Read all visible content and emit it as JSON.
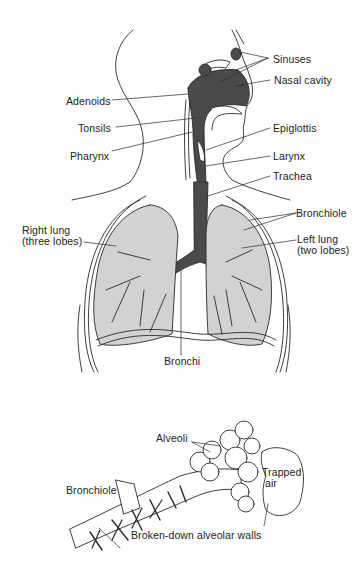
{
  "diagram": {
    "type": "anatomical-illustration",
    "upper_panel": {
      "labels": {
        "sinuses": "Sinuses",
        "nasal_cavity": "Nasal cavity",
        "adenoids": "Adenoids",
        "tonsils": "Tonsils",
        "pharynx": "Pharynx",
        "epiglottis": "Epiglottis",
        "larynx": "Larynx",
        "trachea": "Trachea",
        "bronchiole": "Bronchiole",
        "right_lung_line1": "Right lung",
        "right_lung_line2": "(three lobes)",
        "left_lung_line1": "Left lung",
        "left_lung_line2": "(two lobes)",
        "bronchi": "Bronchi"
      }
    },
    "lower_panel": {
      "labels": {
        "alveoli": "Alveoli",
        "trapped_line1": "Trapped",
        "trapped_line2": "air",
        "bronchiole": "Bronchiole",
        "broken_walls": "Broken-down alveolar walls"
      }
    },
    "colors": {
      "line": "#2a2a2a",
      "airway_fill": "#4a4a4a",
      "lung_fill": "#d2d2d2",
      "background": "#ffffff"
    }
  }
}
